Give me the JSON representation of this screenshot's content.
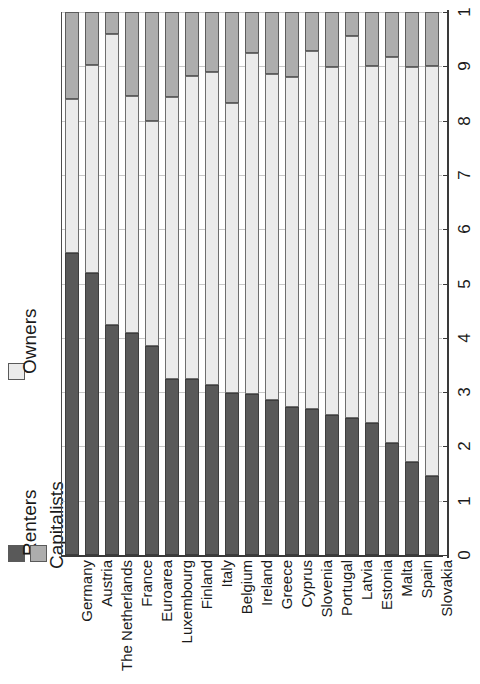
{
  "chart_data": {
    "type": "bar",
    "subtype": "stacked-bar-100pct-horizontalcategories-rotated",
    "title": "",
    "xlabel": "",
    "ylabel": "",
    "ylim": [
      0,
      1
    ],
    "grid": true,
    "orientation": "rotated-90",
    "legend": {
      "position": "left",
      "entries": [
        {
          "name": "Renters",
          "color": "#595959"
        },
        {
          "name": "Owners",
          "color": "#ebebeb"
        },
        {
          "name": "Capitalists",
          "color": "#adadad"
        }
      ]
    },
    "categories": [
      "Germany",
      "Austria",
      "The Netherlands",
      "France",
      "Euroarea",
      "Luxembourg",
      "Finland",
      "Italy",
      "Belgium",
      "Ireland",
      "Greece",
      "Cyprus",
      "Slovenia",
      "Portugal",
      "Latvia",
      "Estonia",
      "Malta",
      "Spain",
      "Slovakia"
    ],
    "series": [
      {
        "name": "Renters",
        "color": "#595959",
        "values": [
          0.557,
          0.52,
          0.423,
          0.408,
          0.385,
          0.324,
          0.325,
          0.313,
          0.298,
          0.297,
          0.285,
          0.272,
          0.268,
          0.258,
          0.252,
          0.243,
          0.207,
          0.172,
          0.145
        ]
      },
      {
        "name": "Owners",
        "color": "#ebebeb",
        "values": [
          0.283,
          0.383,
          0.536,
          0.437,
          0.415,
          0.52,
          0.558,
          0.577,
          0.535,
          0.627,
          0.601,
          0.608,
          0.66,
          0.641,
          0.703,
          0.657,
          0.711,
          0.726,
          0.755
        ]
      },
      {
        "name": "Capitalists",
        "color": "#adadad",
        "values": [
          0.16,
          0.097,
          0.041,
          0.155,
          0.2,
          0.156,
          0.117,
          0.11,
          0.167,
          0.076,
          0.114,
          0.12,
          0.072,
          0.101,
          0.045,
          0.1,
          0.082,
          0.102,
          0.1
        ]
      }
    ],
    "value_axis": {
      "ticks": [
        0,
        0.1,
        0.2,
        0.3,
        0.4,
        0.5,
        0.6,
        0.7,
        0.8,
        0.9,
        1.0
      ],
      "tick_labels": [
        ".0",
        ".1",
        ".2",
        ".3",
        ".4",
        ".5",
        ".6",
        ".7",
        ".8",
        ".9",
        "1"
      ]
    }
  }
}
